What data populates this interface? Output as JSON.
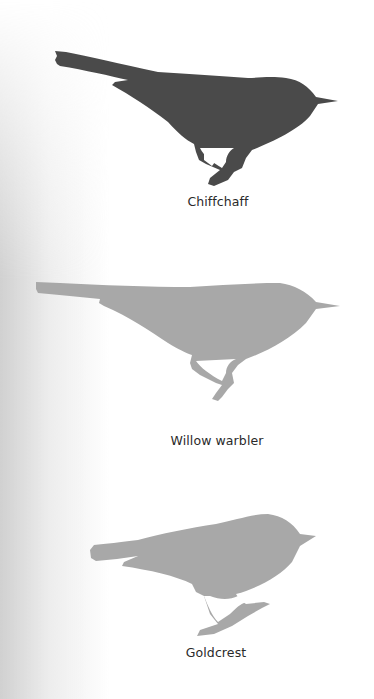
{
  "birds": [
    {
      "name": "Chiffchaff",
      "color": "#4a4a4a"
    },
    {
      "name": "Willow warbler",
      "color": "#a8a8a8"
    },
    {
      "name": "Goldcrest",
      "color": "#a8a8a8"
    }
  ]
}
